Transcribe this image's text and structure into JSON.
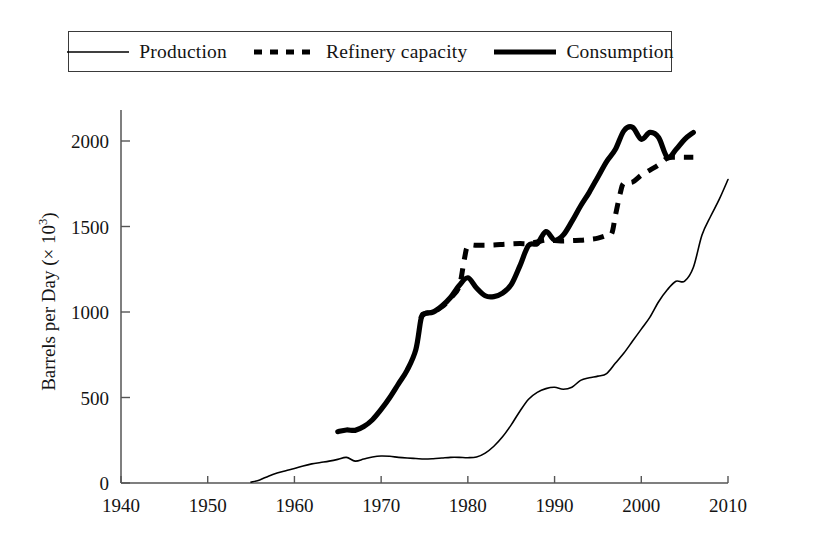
{
  "legend": {
    "entries": [
      {
        "label": "Production",
        "style": "thin-solid",
        "color": "#000000"
      },
      {
        "label": "Refinery capacity",
        "style": "dashed",
        "color": "#000000"
      },
      {
        "label": "Consumption",
        "style": "thick-solid",
        "color": "#000000"
      }
    ]
  },
  "axes": {
    "y_title_main": "Barrels per Day (× 10",
    "y_title_exp": "3",
    "y_title_tail": ")",
    "x_ticks": [
      "1940",
      "1950",
      "1960",
      "1970",
      "1980",
      "1990",
      "2000",
      "2010"
    ],
    "y_ticks": [
      "0",
      "500",
      "1000",
      "1500",
      "2000"
    ]
  },
  "chart_data": {
    "type": "line",
    "title": "",
    "xlabel": "",
    "ylabel": "Barrels per Day (× 10^3)",
    "xlim": [
      1940,
      2010
    ],
    "ylim": [
      0,
      2150
    ],
    "xticks": [
      1940,
      1950,
      1960,
      1970,
      1980,
      1990,
      2000,
      2010
    ],
    "yticks": [
      0,
      500,
      1000,
      1500,
      2000
    ],
    "grid": false,
    "legend_position": "top-center",
    "series": [
      {
        "name": "Production",
        "style": "thin-solid",
        "color": "#000000",
        "width": 1.6,
        "points": [
          [
            1955.0,
            5
          ],
          [
            1956.0,
            18
          ],
          [
            1957.0,
            40
          ],
          [
            1958.0,
            58
          ],
          [
            1959.0,
            72
          ],
          [
            1960.0,
            85
          ],
          [
            1961.0,
            100
          ],
          [
            1962.0,
            112
          ],
          [
            1963.0,
            120
          ],
          [
            1964.0,
            128
          ],
          [
            1965.0,
            138
          ],
          [
            1966.0,
            150
          ],
          [
            1967.0,
            128
          ],
          [
            1968.0,
            140
          ],
          [
            1969.0,
            152
          ],
          [
            1970.0,
            158
          ],
          [
            1971.0,
            156
          ],
          [
            1972.0,
            150
          ],
          [
            1973.0,
            146
          ],
          [
            1974.0,
            143
          ],
          [
            1975.0,
            140
          ],
          [
            1976.0,
            142
          ],
          [
            1977.0,
            146
          ],
          [
            1978.0,
            150
          ],
          [
            1979.0,
            150
          ],
          [
            1980.0,
            148
          ],
          [
            1981.0,
            152
          ],
          [
            1982.0,
            175
          ],
          [
            1983.0,
            215
          ],
          [
            1984.0,
            270
          ],
          [
            1985.0,
            340
          ],
          [
            1986.0,
            420
          ],
          [
            1987.0,
            490
          ],
          [
            1988.0,
            530
          ],
          [
            1989.0,
            552
          ],
          [
            1990.0,
            560
          ],
          [
            1991.0,
            548
          ],
          [
            1992.0,
            560
          ],
          [
            1993.0,
            600
          ],
          [
            1994.0,
            615
          ],
          [
            1995.0,
            625
          ],
          [
            1996.0,
            640
          ],
          [
            1997.0,
            700
          ],
          [
            1998.0,
            760
          ],
          [
            1999.0,
            830
          ],
          [
            2000.0,
            900
          ],
          [
            2001.0,
            970
          ],
          [
            2002.0,
            1060
          ],
          [
            2003.0,
            1130
          ],
          [
            2004.0,
            1180
          ],
          [
            2005.0,
            1180
          ],
          [
            2006.0,
            1260
          ],
          [
            2007.0,
            1450
          ],
          [
            2008.0,
            1560
          ],
          [
            2009.0,
            1660
          ],
          [
            2010.0,
            1775
          ]
        ]
      },
      {
        "name": "Refinery capacity",
        "style": "dashed",
        "color": "#000000",
        "width": 5.0,
        "points": [
          [
            1974.5,
            960
          ],
          [
            1975.0,
            990
          ],
          [
            1976.0,
            1000
          ],
          [
            1977.0,
            1030
          ],
          [
            1978.0,
            1080
          ],
          [
            1979.0,
            1150
          ],
          [
            1979.6,
            1310
          ],
          [
            1980.0,
            1385
          ],
          [
            1981.0,
            1390
          ],
          [
            1982.0,
            1390
          ],
          [
            1983.0,
            1392
          ],
          [
            1984.0,
            1395
          ],
          [
            1985.0,
            1398
          ],
          [
            1986.0,
            1400
          ],
          [
            1987.0,
            1400
          ],
          [
            1988.0,
            1410
          ],
          [
            1989.0,
            1420
          ],
          [
            1990.0,
            1418
          ],
          [
            1991.0,
            1415
          ],
          [
            1992.0,
            1418
          ],
          [
            1993.0,
            1420
          ],
          [
            1994.0,
            1425
          ],
          [
            1995.0,
            1432
          ],
          [
            1996.0,
            1448
          ],
          [
            1996.6,
            1460
          ],
          [
            1997.0,
            1560
          ],
          [
            1997.6,
            1700
          ],
          [
            1998.0,
            1755
          ],
          [
            1999.0,
            1760
          ],
          [
            2000.0,
            1800
          ],
          [
            2001.0,
            1830
          ],
          [
            2002.0,
            1860
          ],
          [
            2003.0,
            1900
          ],
          [
            2004.0,
            1905
          ],
          [
            2005.0,
            1905
          ],
          [
            2006.0,
            1905
          ]
        ]
      },
      {
        "name": "Consumption",
        "style": "thick-solid",
        "color": "#000000",
        "width": 5.2,
        "points": [
          [
            1965.0,
            300
          ],
          [
            1966.0,
            310
          ],
          [
            1967.0,
            308
          ],
          [
            1968.0,
            330
          ],
          [
            1969.0,
            370
          ],
          [
            1970.0,
            430
          ],
          [
            1971.0,
            500
          ],
          [
            1972.0,
            580
          ],
          [
            1973.0,
            660
          ],
          [
            1974.0,
            780
          ],
          [
            1974.6,
            960
          ],
          [
            1975.0,
            990
          ],
          [
            1976.0,
            1000
          ],
          [
            1977.0,
            1035
          ],
          [
            1978.0,
            1085
          ],
          [
            1979.0,
            1155
          ],
          [
            1980.0,
            1200
          ],
          [
            1981.0,
            1140
          ],
          [
            1982.0,
            1095
          ],
          [
            1983.0,
            1090
          ],
          [
            1984.0,
            1110
          ],
          [
            1985.0,
            1160
          ],
          [
            1986.0,
            1270
          ],
          [
            1987.0,
            1390
          ],
          [
            1988.0,
            1400
          ],
          [
            1989.0,
            1470
          ],
          [
            1990.0,
            1420
          ],
          [
            1991.0,
            1450
          ],
          [
            1992.0,
            1530
          ],
          [
            1993.0,
            1620
          ],
          [
            1994.0,
            1700
          ],
          [
            1995.0,
            1790
          ],
          [
            1996.0,
            1880
          ],
          [
            1997.0,
            1950
          ],
          [
            1998.0,
            2060
          ],
          [
            1999.0,
            2080
          ],
          [
            2000.0,
            2010
          ],
          [
            2001.0,
            2050
          ],
          [
            2002.0,
            2020
          ],
          [
            2003.0,
            1905
          ],
          [
            2004.0,
            1950
          ],
          [
            2005.0,
            2010
          ],
          [
            2006.0,
            2050
          ]
        ]
      }
    ]
  }
}
